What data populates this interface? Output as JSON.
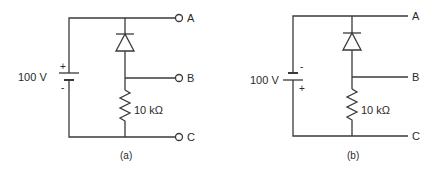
{
  "figure": {
    "panels": [
      {
        "id": "a",
        "caption": "(a)",
        "source": {
          "voltage_label": "100 V",
          "top_polarity": "+",
          "bottom_polarity": "-"
        },
        "resistor_label": "10 kΩ",
        "terminals": [
          "A",
          "B",
          "C"
        ],
        "terminal_style": "open-circle"
      },
      {
        "id": "b",
        "caption": "(b)",
        "source": {
          "voltage_label": "100 V",
          "top_polarity": "-",
          "bottom_polarity": "+"
        },
        "resistor_label": "10 kΩ",
        "terminals": [
          "A",
          "B",
          "C"
        ],
        "terminal_style": "plain-line"
      }
    ],
    "colors": {
      "line": "#3a3a3a",
      "text": "#2a2a2a",
      "background": "#ffffff"
    }
  }
}
